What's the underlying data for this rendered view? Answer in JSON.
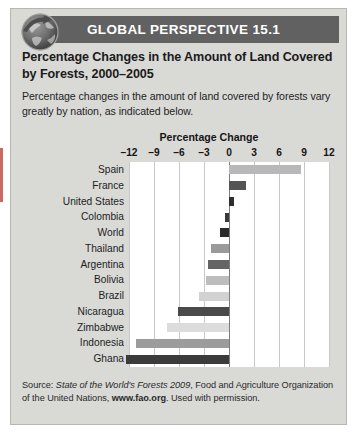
{
  "banner": {
    "title": "GLOBAL PERSPECTIVE 15.1",
    "icon": "globe-arrow-icon",
    "background_color": "#616161",
    "text_color": "#ffffff"
  },
  "panel": {
    "heading": "Percentage Changes in the Amount of Land Covered by Forests, 2000–2005",
    "subheading": "Percentage changes in the amount of land covered by forests vary greatly by nation, as indicated below."
  },
  "source": {
    "prefix": "Source: ",
    "italic_title": "State of the World's Forests 2009",
    "middle": ", Food and Agriculture Organization of the United Nations, ",
    "bold_url": "www.fao.org",
    "suffix": ". Used with permission."
  },
  "chart_data": {
    "type": "bar",
    "orientation": "horizontal",
    "title": "Percentage Change",
    "xlabel": "Percentage Change",
    "ylabel": "",
    "xlim": [
      -12,
      12
    ],
    "xticks": [
      -12,
      -9,
      -6,
      -3,
      0,
      3,
      6,
      9,
      12
    ],
    "xtick_labels": [
      "–12",
      "–9",
      "–6",
      "–3",
      "0",
      "3",
      "6",
      "9",
      "12"
    ],
    "grid": true,
    "legend": "none",
    "categories": [
      "Spain",
      "France",
      "United States",
      "Colombia",
      "World",
      "Thailand",
      "Argentina",
      "Bolivia",
      "Brazil",
      "Nicaragua",
      "Zimbabwe",
      "Indonesia",
      "Ghana"
    ],
    "values": [
      8.6,
      2.0,
      0.6,
      -0.5,
      -1.1,
      -2.2,
      -2.5,
      -2.8,
      -3.6,
      -6.1,
      -7.5,
      -11.2,
      -12.4
    ],
    "bar_colors": [
      "#b8b8b8",
      "#545454",
      "#2e2e2e",
      "#3a3a3a",
      "#2a2a2a",
      "#9a9a9a",
      "#646464",
      "#bdbdbd",
      "#d2d2d2",
      "#4a4a4a",
      "#dcdcdc",
      "#9c9c9c",
      "#3b3b3b"
    ]
  }
}
